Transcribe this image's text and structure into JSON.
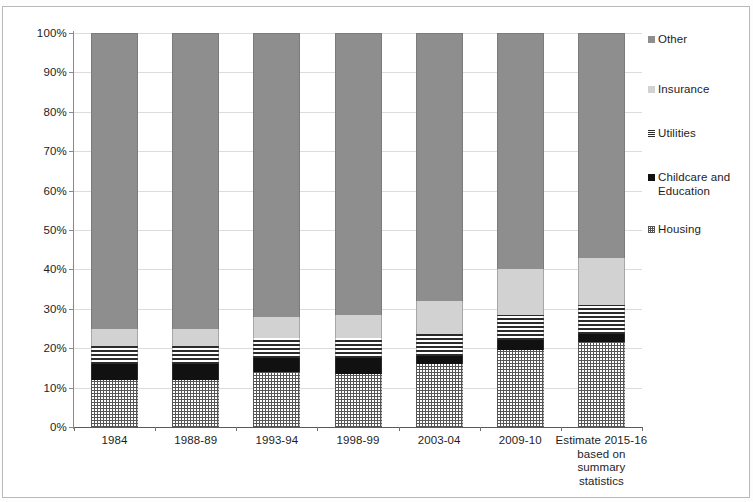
{
  "chart_data": {
    "type": "bar",
    "subtype": "stacked-100-percent",
    "title": "",
    "xlabel": "",
    "ylabel": "",
    "ylim": [
      0,
      100
    ],
    "ytick_labels": [
      "0%",
      "10%",
      "20%",
      "30%",
      "40%",
      "50%",
      "60%",
      "70%",
      "80%",
      "90%",
      "100%"
    ],
    "ytick_values": [
      0,
      10,
      20,
      30,
      40,
      50,
      60,
      70,
      80,
      90,
      100
    ],
    "grid": true,
    "legend_position": "right",
    "categories": [
      "1984",
      "1988-89",
      "1993-94",
      "1998-99",
      "2003-04",
      "2009-10",
      "Estimate 2015-16 based on summary statistics"
    ],
    "series": [
      {
        "name": "Housing",
        "pattern": "crosshatch",
        "color": "#555555",
        "values": [
          12.0,
          12.0,
          14.0,
          13.5,
          16.0,
          19.5,
          21.5
        ]
      },
      {
        "name": "Childcare and Education",
        "pattern": "solid-dark",
        "color": "#111111",
        "values": [
          4.0,
          4.0,
          3.5,
          4.0,
          2.0,
          2.5,
          2.0
        ]
      },
      {
        "name": "Utilities",
        "pattern": "horizontal-lines",
        "color": "#2b2b2b",
        "values": [
          4.5,
          4.5,
          5.0,
          5.0,
          5.5,
          6.5,
          7.5
        ]
      },
      {
        "name": "Insurance",
        "pattern": "solid-light",
        "color": "#d2d2d2",
        "values": [
          4.5,
          4.5,
          5.5,
          6.0,
          8.5,
          11.5,
          12.0
        ]
      },
      {
        "name": "Other",
        "pattern": "solid-mid",
        "color": "#8e8e8e",
        "values": [
          75.0,
          75.0,
          72.0,
          71.5,
          68.0,
          60.0,
          57.0
        ]
      }
    ],
    "legend_entries": [
      {
        "label": "Other",
        "swatch": "sw-other"
      },
      {
        "label": "Insurance",
        "swatch": "sw-insurance"
      },
      {
        "label": "Utilities",
        "swatch": "sw-utilities"
      },
      {
        "label": "Childcare and Education",
        "swatch": "sw-childcare"
      },
      {
        "label": "Housing",
        "swatch": "sw-housing"
      }
    ]
  }
}
